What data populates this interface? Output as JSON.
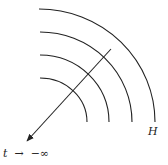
{
  "diagram": {
    "arcs": [
      {
        "name": "arc-1",
        "start": [
          39,
          9
        ],
        "end": [
          155,
          122
        ],
        "rx": 116,
        "ry": 113
      },
      {
        "name": "arc-2",
        "start": [
          40,
          32
        ],
        "end": [
          132,
          122
        ],
        "rx": 92,
        "ry": 90
      },
      {
        "name": "arc-3",
        "start": [
          40,
          55
        ],
        "end": [
          109,
          122
        ],
        "rx": 69,
        "ry": 67
      },
      {
        "name": "arc-4",
        "start": [
          40,
          78
        ],
        "end": [
          87,
          122
        ],
        "rx": 47,
        "ry": 44
      }
    ],
    "ray": {
      "from": [
        111,
        49
      ],
      "to": [
        26,
        142
      ]
    },
    "labels": {
      "horizon": "H",
      "limit_var": "t",
      "limit_arrow": "→",
      "limit_value": "−∞"
    },
    "colors": {
      "stroke": "#222222",
      "background": "#ffffff"
    }
  }
}
